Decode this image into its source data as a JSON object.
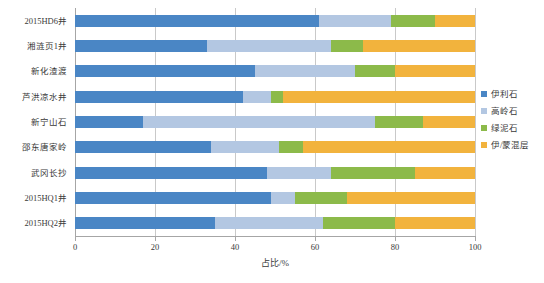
{
  "chart_data": {
    "type": "bar",
    "orientation": "horizontal",
    "stacked": true,
    "stack_mode": "percent",
    "title": "",
    "xlabel": "占比/%",
    "ylabel": "",
    "xlim": [
      0,
      100
    ],
    "xticks": [
      "0",
      "20",
      "40",
      "60",
      "80",
      "100"
    ],
    "grid": true,
    "grid_axis": "x",
    "legend_position": "right",
    "categories": [
      "2015HD6井",
      "湘涟页1井",
      "新化渣渡",
      "芦洪凉水井",
      "新宁山石",
      "邵东唐家岭",
      "武冈长抄",
      "2015HQ1井",
      "2015HQ2井"
    ],
    "series": [
      {
        "name": "伊利石",
        "color": "#4a86c5",
        "values": [
          61,
          33,
          45,
          42,
          17,
          34,
          48,
          49,
          35
        ]
      },
      {
        "name": "高岭石",
        "color": "#b3c7e2",
        "values": [
          18,
          31,
          25,
          7,
          58,
          17,
          16,
          6,
          27
        ]
      },
      {
        "name": "绿泥石",
        "color": "#8cba4a",
        "values": [
          11,
          8,
          10,
          3,
          12,
          6,
          21,
          13,
          18
        ]
      },
      {
        "name": "伊/蒙混层",
        "color": "#f2b33d",
        "values": [
          10,
          28,
          20,
          48,
          13,
          43,
          15,
          32,
          20
        ]
      }
    ]
  }
}
